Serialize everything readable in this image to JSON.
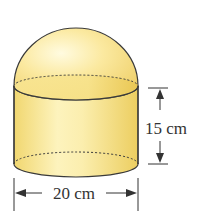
{
  "figure": {
    "shapes": [
      "hemisphere",
      "cylinder"
    ],
    "colors": {
      "fill_light": "#fdf3b8",
      "fill_mid": "#f6e08a",
      "fill_dark": "#e8c95a",
      "outline": "#3a3a3a"
    }
  },
  "dimensions": {
    "height": {
      "label": "15 cm",
      "value": 15,
      "unit": "cm"
    },
    "diameter": {
      "label": "20 cm",
      "value": 20,
      "unit": "cm"
    }
  }
}
